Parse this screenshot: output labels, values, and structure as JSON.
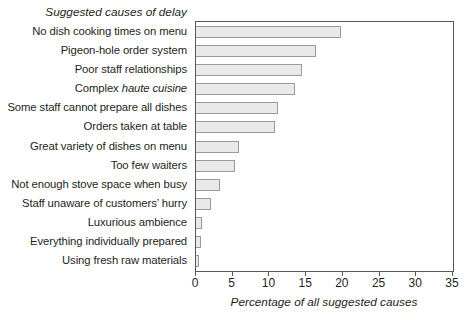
{
  "chart_data": {
    "type": "bar",
    "orientation": "horizontal",
    "title": "Suggested causes of delay",
    "xlabel": "Percentage of all suggested causes",
    "ylabel": "",
    "xlim": [
      0,
      35
    ],
    "xticks": [
      0,
      5,
      10,
      15,
      20,
      25,
      30,
      35
    ],
    "xtick_labels": [
      "0",
      "5",
      "10",
      "15",
      "20",
      "25",
      "30",
      "35"
    ],
    "grid": false,
    "legend": null,
    "bar_fill_color": "#e9e9e9",
    "bar_border_color": "#9a9a9c",
    "axis_color": "#58585a",
    "categories": [
      "No dish cooking times on menu",
      "Pigeon-hole order system",
      "Poor staff relationships",
      "Complex haute cuisine",
      "Some staff cannot prepare all dishes",
      "Orders taken at table",
      "Great variety of dishes on menu",
      "Too few waiters",
      "Not enough stove space when busy",
      "Staff unaware of customers' hurry",
      "Luxurious ambience",
      "Everything individually prepared",
      "Using fresh raw materials"
    ],
    "values": [
      19.8,
      16.3,
      14.5,
      13.5,
      11.1,
      10.7,
      5.8,
      5.3,
      3.3,
      2.0,
      0.8,
      0.7,
      0.4
    ]
  },
  "bars": [
    {
      "label_html": "No dish cooking times on menu",
      "label": "No dish cooking times on menu",
      "value": 19.8
    },
    {
      "label_html": "Pigeon-hole order system",
      "label": "Pigeon-hole order system",
      "value": 16.3
    },
    {
      "label_html": "Poor staff relationships",
      "label": "Poor staff relationships",
      "value": 14.5
    },
    {
      "label_html": "Complex <i>haute cuisine</i>",
      "label": "Complex haute cuisine",
      "value": 13.5
    },
    {
      "label_html": "Some staff cannot prepare all dishes",
      "label": "Some staff cannot prepare all dishes",
      "value": 11.1
    },
    {
      "label_html": "Orders taken at table",
      "label": "Orders taken at table",
      "value": 10.7
    },
    {
      "label_html": "Great variety of dishes on menu",
      "label": "Great variety of dishes on menu",
      "value": 5.8
    },
    {
      "label_html": "Too few waiters",
      "label": "Too few waiters",
      "value": 5.3
    },
    {
      "label_html": "Not enough stove space when busy",
      "label": "Not enough stove space when busy",
      "value": 3.3
    },
    {
      "label_html": "Staff unaware of customers&rsquo; hurry",
      "label": "Staff unaware of customers' hurry",
      "value": 2.0
    },
    {
      "label_html": "Luxurious ambience",
      "label": "Luxurious ambience",
      "value": 0.8
    },
    {
      "label_html": "Everything individually prepared",
      "label": "Everything individually prepared",
      "value": 0.7
    },
    {
      "label_html": "Using fresh raw materials",
      "label": "Using fresh raw materials",
      "value": 0.4
    }
  ]
}
